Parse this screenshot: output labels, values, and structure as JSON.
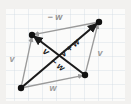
{
  "figure": {
    "type": "vector-diagram",
    "background_color": "#f2f1ef",
    "paper_color": "#fbfbfa",
    "grid_color": "#ccd6e0",
    "grid_spacing": 14,
    "accent_dark": "#1a1a1a",
    "accent_gray": "#9a9a9a"
  },
  "vertices": [
    {
      "name": "origin-vertex",
      "id": "O",
      "x": 21,
      "y": 88
    },
    {
      "name": "upper-left-vertex",
      "id": "A",
      "x": 32,
      "y": 35
    },
    {
      "name": "upper-right-vertex",
      "id": "B",
      "x": 99,
      "y": 22
    },
    {
      "name": "lower-right-vertex",
      "id": "C",
      "x": 85,
      "y": 75
    }
  ],
  "arrows": [
    {
      "name": "vector-v-left",
      "label": "v",
      "color": "#9a9a9a",
      "weight": "thin",
      "from": [
        21,
        88
      ],
      "to": [
        32,
        35
      ],
      "label_pos": [
        12,
        60
      ],
      "label_rotation": 0
    },
    {
      "name": "vector-w-bottom",
      "label": "w",
      "color": "#9a9a9a",
      "weight": "thin",
      "from": [
        21,
        88
      ],
      "to": [
        85,
        75
      ],
      "label_pos": [
        52,
        84
      ],
      "label_rotation": 0
    },
    {
      "name": "vector-v-right",
      "label": "v",
      "color": "#9a9a9a",
      "weight": "thin",
      "from": [
        85,
        75
      ],
      "to": [
        99,
        22
      ],
      "label_pos": [
        97,
        52
      ],
      "label_rotation": 0
    },
    {
      "name": "vector-negative-w-top",
      "label": "− w",
      "color": "#9a9a9a",
      "weight": "thin",
      "from": [
        99,
        22
      ],
      "to": [
        32,
        35
      ],
      "label_pos": [
        56,
        16
      ],
      "label_rotation": 0
    },
    {
      "name": "vector-v-plus-w",
      "label": "v + w",
      "color": "#1a1a1a",
      "weight": "bold",
      "from": [
        21,
        88
      ],
      "to": [
        99,
        22
      ],
      "label_pos": [
        76,
        45
      ],
      "label_rotation": -40
    },
    {
      "name": "vector-v-minus-w",
      "label": "v − w",
      "color": "#1a1a1a",
      "weight": "bold",
      "from": [
        85,
        75
      ],
      "to": [
        32,
        35
      ],
      "label_pos": [
        50,
        52
      ],
      "label_rotation": 37
    }
  ],
  "labels": [
    {
      "name": "label-v-left",
      "text": "v",
      "x": 12,
      "y": 62,
      "rotation": 0,
      "color": "#9a9a9a",
      "size": 9
    },
    {
      "name": "label-w-bottom",
      "text": "w",
      "x": 50,
      "y": 88,
      "rotation": 0,
      "color": "#9a9a9a",
      "size": 9
    },
    {
      "name": "label-v-right",
      "text": "v",
      "x": 99,
      "y": 55,
      "rotation": 0,
      "color": "#9a9a9a",
      "size": 9
    },
    {
      "name": "label-negative-w",
      "text": "− w",
      "x": 52,
      "y": 19,
      "rotation": 0,
      "color": "#8f8f8f",
      "size": 9
    },
    {
      "name": "label-v-plus-w",
      "text": "v + w",
      "x": 72,
      "y": 50,
      "rotation": -41,
      "color": "#1a1a1a",
      "size": 9
    },
    {
      "name": "label-v-minus-w-v",
      "text": "v",
      "x": 45,
      "y": 52,
      "rotation": 37,
      "color": "#1a1a1a",
      "size": 9
    },
    {
      "name": "label-v-minus-w-rest",
      "text": "− w",
      "x": 53,
      "y": 64,
      "rotation": 37,
      "color": "#1a1a1a",
      "size": 9
    }
  ]
}
